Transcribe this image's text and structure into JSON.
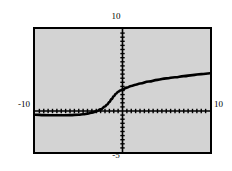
{
  "figure": {
    "background_color": "#ffffff",
    "plot_fill_color": "#d3d3d3",
    "frame_color": "#000000",
    "curve_color": "#000000"
  },
  "labels": {
    "top": "10",
    "left": "-10",
    "right": "10",
    "bottom": "-5"
  },
  "chart_data": {
    "type": "line",
    "title": "",
    "xlabel": "",
    "ylabel": "",
    "xlim": [
      -10,
      10
    ],
    "ylim": [
      -5,
      10
    ],
    "grid": false,
    "legend": null,
    "axis_tick_labels": {
      "top": "10",
      "left": "-10",
      "right": "10",
      "bottom": "-5"
    },
    "x_axis_ticks_count": 40,
    "y_axis_ticks_count": 30,
    "series": [
      {
        "name": "curve",
        "x": [
          -10.0,
          -9.0,
          -8.0,
          -7.0,
          -6.0,
          -5.0,
          -4.5,
          -4.0,
          -3.5,
          -3.0,
          -2.5,
          -2.0,
          -1.75,
          -1.5,
          -1.25,
          -1.0,
          -0.75,
          -0.5,
          -0.25,
          0.0,
          0.5,
          1.0,
          1.5,
          2.0,
          3.0,
          4.0,
          5.0,
          6.0,
          7.0,
          8.0,
          9.0,
          10.0
        ],
        "y": [
          -0.45,
          -0.5,
          -0.52,
          -0.52,
          -0.5,
          -0.45,
          -0.4,
          -0.32,
          -0.2,
          -0.05,
          0.2,
          0.55,
          0.8,
          1.1,
          1.45,
          1.8,
          2.1,
          2.35,
          2.5,
          2.62,
          2.85,
          3.05,
          3.2,
          3.35,
          3.6,
          3.8,
          3.98,
          4.12,
          4.25,
          4.38,
          4.5,
          4.6
        ]
      }
    ]
  }
}
